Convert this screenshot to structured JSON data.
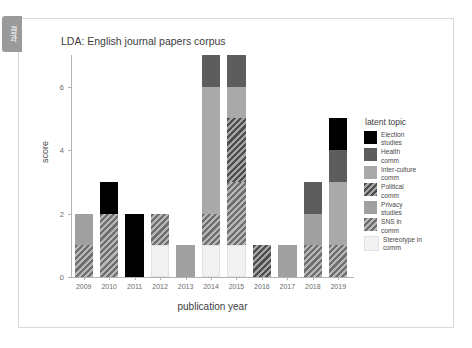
{
  "section_tab": {
    "label": "결과"
  },
  "chart_data": {
    "type": "bar",
    "subtype": "stacked",
    "title": "LDA: English journal papers corpus",
    "xlabel": "publication year",
    "ylabel": "score",
    "categories": [
      "2009",
      "2010",
      "2011",
      "2012",
      "2013",
      "2014",
      "2015",
      "2016",
      "2017",
      "2018",
      "2019"
    ],
    "ylim": [
      0,
      7
    ],
    "yticks": [
      0,
      2,
      4,
      6
    ],
    "ytick_labels": [
      "0",
      "2",
      "4",
      "6"
    ],
    "grid": false,
    "legend_title": "latent topic",
    "legend_position": "right",
    "series": [
      {
        "name": "Election studies",
        "color": "#000000",
        "hatch": "none",
        "values": [
          0,
          1,
          2,
          0,
          0,
          0,
          0,
          0,
          0,
          0,
          1
        ]
      },
      {
        "name": "Health comm",
        "color": "#5d5d5d",
        "hatch": "none",
        "values": [
          0,
          0,
          0,
          0,
          0,
          1,
          1,
          0,
          0,
          1,
          1
        ]
      },
      {
        "name": "Inter-culture comm",
        "color": "#a9a9a9",
        "hatch": "none",
        "values": [
          0,
          0,
          0,
          0,
          0,
          4,
          1,
          0,
          0,
          0,
          2
        ]
      },
      {
        "name": "Political comm",
        "color": "#4d4d4d",
        "hatch": "diagonal",
        "values": [
          0,
          0,
          0,
          0,
          0,
          0,
          2,
          1,
          0,
          0,
          0
        ]
      },
      {
        "name": "Privacy studies",
        "color": "#a0a0a0",
        "hatch": "none",
        "values": [
          1,
          0,
          0,
          0,
          1,
          0,
          0,
          0,
          1,
          1,
          0
        ]
      },
      {
        "name": "SNS in comm",
        "color": "#6e6e6e",
        "hatch": "diagonal",
        "values": [
          1,
          2,
          0,
          1,
          0,
          1,
          2,
          0,
          0,
          1,
          1
        ]
      },
      {
        "name": "Stereotype in comm",
        "color": "#f2f2f2",
        "hatch": "none",
        "values": [
          0,
          0,
          0,
          1,
          0,
          1,
          1,
          0,
          0,
          0,
          0
        ]
      }
    ],
    "totals": [
      2,
      3,
      2,
      2,
      1,
      7,
      6,
      1,
      1,
      3,
      5
    ]
  }
}
